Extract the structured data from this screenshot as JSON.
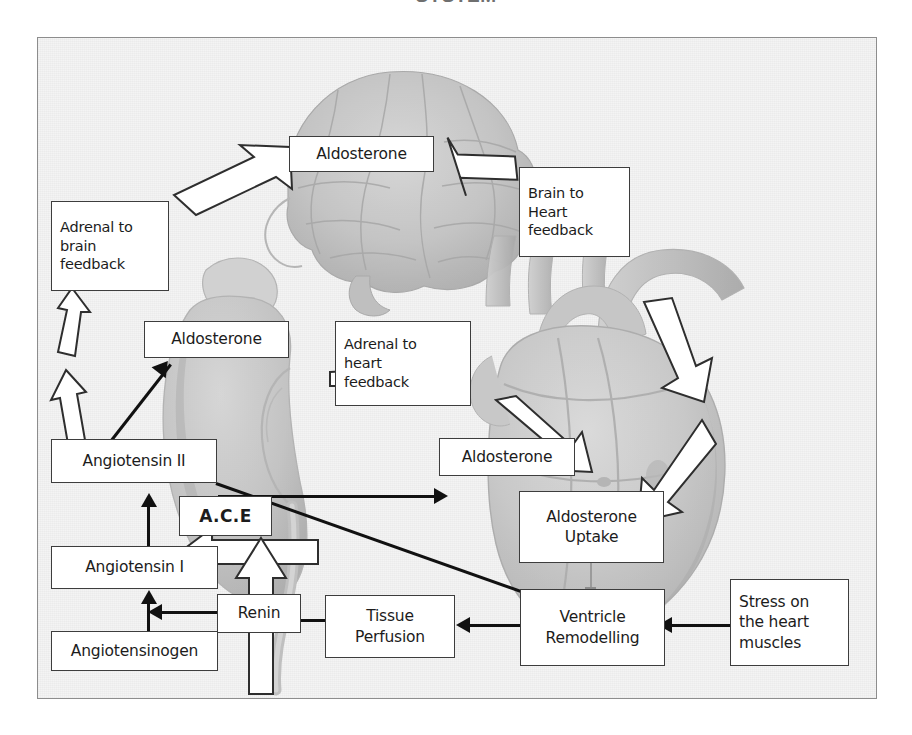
{
  "page": {
    "title_clipped": "SYSTEM",
    "panel_label": "raas-heart-feedback-diagram"
  },
  "colors": {
    "box_border": "#3d3d3d",
    "box_fill": "#ffffff",
    "arrow_black": "#111111",
    "arrow_white_fill": "#ffffff",
    "arrow_white_stroke": "#2e2e2e",
    "panel_bg": "#f3f3f3",
    "panel_border": "#8d8d8d",
    "anatomy_gray": "#b9b9b9"
  },
  "nodes": [
    {
      "id": "aldosterone-brain",
      "label": "Aldosterone"
    },
    {
      "id": "adrenal-to-brain",
      "label": "Adrenal to\nbrain\nfeedback"
    },
    {
      "id": "brain-to-heart",
      "label": "Brain to\nHeart\nfeedback"
    },
    {
      "id": "aldosterone-adrenal",
      "label": "Aldosterone"
    },
    {
      "id": "adrenal-to-heart",
      "label": "Adrenal to\nheart\nfeedback"
    },
    {
      "id": "angiotensin-2",
      "label": "Angiotensin II"
    },
    {
      "id": "aldosterone-heart",
      "label": "Aldosterone"
    },
    {
      "id": "ace",
      "label": "A.C.E"
    },
    {
      "id": "aldosterone-uptake",
      "label": "Aldosterone\nUptake"
    },
    {
      "id": "angiotensin-1",
      "label": "Angiotensin I"
    },
    {
      "id": "angiotensinogen",
      "label": "Angiotensinogen"
    },
    {
      "id": "renin",
      "label": "Renin"
    },
    {
      "id": "tissue-perfusion",
      "label": "Tissue\nPerfusion"
    },
    {
      "id": "ventricle-remodelling",
      "label": "Ventricle\nRemodelling"
    },
    {
      "id": "stress-heart",
      "label": "Stress on\nthe heart\nmuscles"
    }
  ],
  "labels": {
    "aldosterone_brain": "Aldosterone",
    "adrenal_to_brain": "Adrenal to brain feedback",
    "brain_to_heart": "Brain to Heart feedback",
    "aldosterone_adrenal": "Aldosterone",
    "adrenal_to_heart": "Adrenal to heart feedback",
    "angiotensin_2": "Angiotensin II",
    "aldosterone_heart": "Aldosterone",
    "ace": "A.C.E",
    "aldosterone_uptake": "Aldosterone Uptake",
    "angiotensin_1": "Angiotensin I",
    "angiotensinogen": "Angiotensinogen",
    "renin": "Renin",
    "tissue_perfusion": "Tissue Perfusion",
    "ventricle_remodelling": "Ventricle Remodelling",
    "stress_heart": "Stress on the heart muscles"
  },
  "label_lines": {
    "adrenal_to_brain": [
      "Adrenal to",
      "brain",
      "feedback"
    ],
    "brain_to_heart": [
      "Brain to",
      "Heart",
      "feedback"
    ],
    "adrenal_to_heart": [
      "Adrenal to",
      "heart",
      "feedback"
    ],
    "aldosterone_uptake": [
      "Aldosterone",
      "Uptake"
    ],
    "tissue_perfusion": [
      "Tissue",
      "Perfusion"
    ],
    "ventricle_remodelling": [
      "Ventricle",
      "Remodelling"
    ],
    "stress_heart": [
      "Stress on",
      "the heart",
      "muscles"
    ]
  },
  "anatomy": [
    {
      "name": "brain-illustration",
      "position": "top-center"
    },
    {
      "name": "kidney-illustration",
      "position": "mid-left"
    },
    {
      "name": "heart-illustration",
      "position": "mid-right"
    }
  ],
  "arrows": {
    "white_block": [
      {
        "name": "adrenal-to-brain-upper-arrow",
        "direction": "up"
      },
      {
        "name": "adrenal-to-brain-lower-arrow",
        "direction": "up"
      },
      {
        "name": "feedback-to-brain-arrow",
        "direction": "up-right"
      },
      {
        "name": "aldosterone-to-brain-heart-arrow",
        "direction": "down-right"
      },
      {
        "name": "brain-heart-descend-arrow-1",
        "direction": "down-right"
      },
      {
        "name": "brain-heart-descend-arrow-2",
        "direction": "down-left"
      },
      {
        "name": "adrenal-heart-to-aldosterone-arrow",
        "direction": "down-right"
      },
      {
        "name": "aldosterone-to-adrenal-heart-arrow",
        "direction": "right"
      },
      {
        "name": "ace-to-angiotensin-arrow",
        "direction": "left"
      },
      {
        "name": "renin-to-ace-arrow",
        "direction": "up"
      }
    ],
    "black_line": [
      {
        "name": "angiotensin2-to-aldosterone-heart-arrow",
        "direction": "right"
      },
      {
        "name": "angiotensin2-to-aldosterone-adrenal-arrow",
        "direction": "up-right"
      },
      {
        "name": "angiotensin2-to-ventricle-arrow",
        "direction": "down-right"
      },
      {
        "name": "angiotensin1-to-angiotensin2-arrow",
        "direction": "up"
      },
      {
        "name": "angiotensinogen-to-angiotensin1-arrow",
        "direction": "up"
      },
      {
        "name": "renin-to-angiotensin-arrow",
        "direction": "left"
      },
      {
        "name": "tissue-to-renin-arrow",
        "direction": "left"
      },
      {
        "name": "ventricle-to-tissue-arrow",
        "direction": "left"
      },
      {
        "name": "stress-to-ventricle-arrow",
        "direction": "left"
      },
      {
        "name": "uptake-to-ventricle-connector",
        "direction": "down"
      }
    ]
  }
}
